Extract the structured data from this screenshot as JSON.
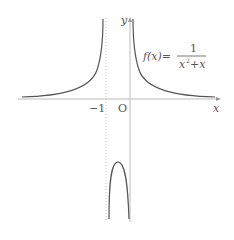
{
  "diagram": {
    "function_label": "f(x)=",
    "fraction_numerator": "1",
    "fraction_denominator_x2": "x",
    "fraction_denominator_exp": "2",
    "fraction_denominator_rest": "+x",
    "axis_x_label": "x",
    "axis_y_label": "y",
    "origin_label": "O",
    "tick_label_neg1": "−1",
    "asymptote_x": -1,
    "colors": {
      "curve": "#555555",
      "axis": "#bbbbbb",
      "asymptote": "#cccccc",
      "text": "#555555"
    }
  }
}
